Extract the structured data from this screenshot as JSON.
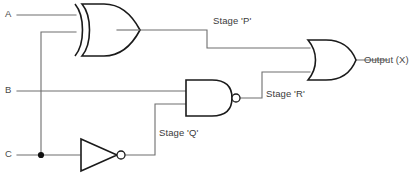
{
  "diagram": {
    "type": "logic-circuit-diagram",
    "background_color": "#ffffff",
    "wire_color": "#6e6e6e",
    "gate_outline_color": "#1a1a1a",
    "text_color": "#3a3a3a"
  },
  "inputs": [
    {
      "id": "A",
      "label": "A",
      "x": 6,
      "y": 9
    },
    {
      "id": "B",
      "label": "B",
      "x": 6,
      "y": 85
    },
    {
      "id": "C",
      "label": "C",
      "x": 6,
      "y": 149
    }
  ],
  "gates": [
    {
      "id": "xor1",
      "kind": "XOR",
      "name": "xor-gate",
      "inputs": [
        "A",
        "C"
      ],
      "output_stage": "P"
    },
    {
      "id": "not1",
      "kind": "NOT",
      "name": "not-gate",
      "inputs": [
        "C"
      ],
      "output_stage": "Q"
    },
    {
      "id": "nand1",
      "kind": "NAND",
      "name": "nand-gate",
      "inputs": [
        "B",
        "Q"
      ],
      "output_stage": "R"
    },
    {
      "id": "or1",
      "kind": "OR",
      "name": "or-gate",
      "inputs": [
        "P",
        "R"
      ],
      "output_stage": "X"
    }
  ],
  "stage_labels": {
    "p": "Stage 'P'",
    "q": "Stage 'Q'",
    "r": "Stage 'R'"
  },
  "output": {
    "label": "Output (X)",
    "x": 364,
    "y": 55
  },
  "junctions": [
    {
      "id": "c-branch",
      "x": 41,
      "y": 155
    }
  ]
}
